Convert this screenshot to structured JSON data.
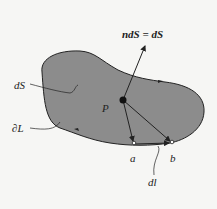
{
  "figure": {
    "labels": {
      "normal_vector": "ndS = dS",
      "surface_element": "dS",
      "point": "P",
      "boundary": "∂L",
      "point_a": "a",
      "point_b": "b",
      "line_element": "dl"
    },
    "colors": {
      "surface_fill": "#8c8c8c",
      "outline": "#222222",
      "background": "#f6f6f4"
    }
  }
}
